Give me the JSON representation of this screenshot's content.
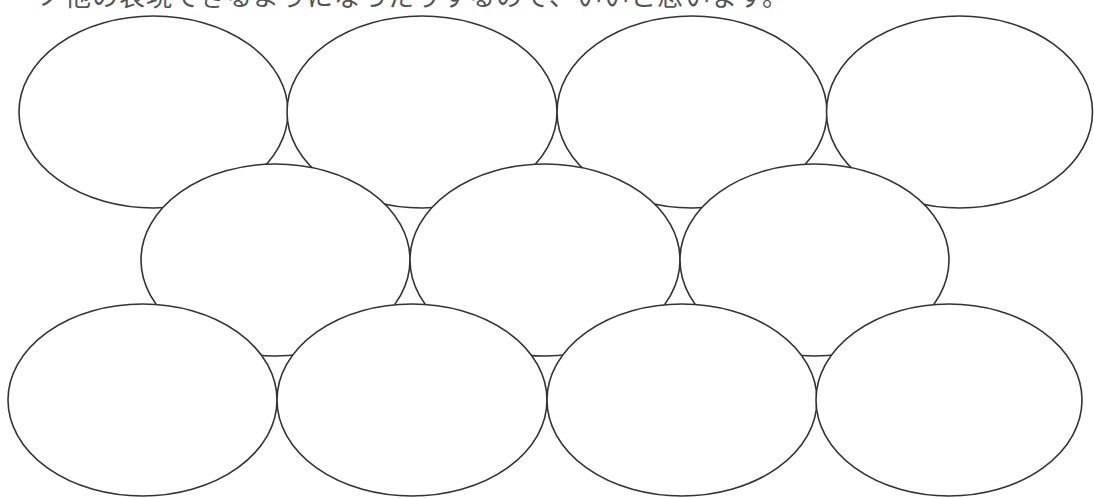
{
  "header": {
    "clipped_text": "ノ他の表現できるようになったりするので、いいと思います。"
  },
  "diagram": {
    "type": "overlapping-ellipse-grid",
    "stroke_color": "#333333",
    "fill_color": "#ffffff",
    "stroke_width": 1.6,
    "rows": [
      {
        "name": "top-row",
        "cy": 112,
        "ry": 96,
        "ellipses": [
          {
            "cx": 153.5,
            "rx": 134.5
          },
          {
            "cx": 422,
            "rx": 135
          },
          {
            "cx": 692,
            "rx": 135
          },
          {
            "cx": 959.5,
            "rx": 133
          }
        ]
      },
      {
        "name": "middle-row",
        "cy": 260,
        "ry": 96,
        "ellipses": [
          {
            "cx": 275.5,
            "rx": 134.5
          },
          {
            "cx": 545,
            "rx": 135
          },
          {
            "cx": 814.5,
            "rx": 134.5
          }
        ]
      },
      {
        "name": "bottom-row",
        "cy": 400,
        "ry": 96,
        "ellipses": [
          {
            "cx": 142.5,
            "rx": 134.5
          },
          {
            "cx": 412,
            "rx": 135
          },
          {
            "cx": 682,
            "rx": 135
          },
          {
            "cx": 949,
            "rx": 133
          }
        ]
      }
    ]
  }
}
